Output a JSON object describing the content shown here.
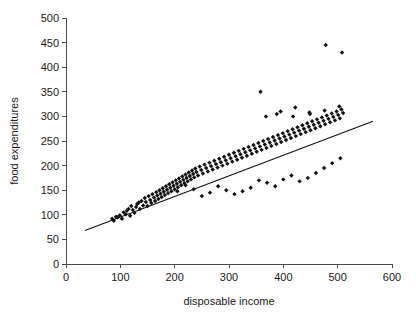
{
  "chart_data": {
    "type": "scatter",
    "title": "",
    "xlabel": "disposable income",
    "ylabel": "food expenditures",
    "xlim": [
      0,
      600
    ],
    "ylim": [
      0,
      500
    ],
    "xticks": [
      0,
      100,
      200,
      300,
      400,
      500,
      600
    ],
    "yticks": [
      0,
      50,
      100,
      150,
      200,
      250,
      300,
      350,
      400,
      450,
      500
    ],
    "grid": false,
    "legend": null,
    "marker": "diamond",
    "marker_color": "#111111",
    "fit_line": {
      "label": "regression line",
      "color": "#111111",
      "x": [
        35,
        565
      ],
      "y": [
        68,
        290
      ]
    },
    "x": [
      85,
      88,
      92,
      95,
      99,
      103,
      106,
      110,
      112,
      115,
      118,
      120,
      123,
      126,
      129,
      131,
      134,
      136,
      139,
      142,
      145,
      147,
      150,
      152,
      155,
      157,
      159,
      162,
      164,
      166,
      168,
      170,
      172,
      174,
      176,
      178,
      180,
      182,
      184,
      186,
      188,
      190,
      192,
      194,
      196,
      198,
      200,
      202,
      204,
      206,
      208,
      210,
      212,
      214,
      216,
      218,
      220,
      222,
      224,
      226,
      228,
      230,
      232,
      234,
      236,
      238,
      240,
      243,
      246,
      249,
      252,
      255,
      258,
      261,
      264,
      267,
      270,
      273,
      276,
      279,
      282,
      285,
      288,
      291,
      294,
      297,
      300,
      303,
      306,
      309,
      312,
      315,
      318,
      321,
      324,
      327,
      330,
      333,
      336,
      339,
      342,
      345,
      348,
      351,
      354,
      357,
      360,
      363,
      366,
      369,
      372,
      375,
      378,
      381,
      384,
      387,
      390,
      393,
      396,
      399,
      402,
      405,
      408,
      411,
      414,
      417,
      420,
      423,
      426,
      429,
      432,
      435,
      438,
      441,
      444,
      447,
      450,
      453,
      456,
      459,
      462,
      465,
      468,
      471,
      474,
      477,
      480,
      483,
      486,
      489,
      492,
      495,
      498,
      501,
      504,
      507,
      510,
      355,
      370,
      385,
      400,
      415,
      430,
      445,
      460,
      475,
      490,
      505,
      340,
      325,
      310,
      295,
      280,
      265,
      250,
      235,
      220,
      205,
      368,
      395,
      422,
      449,
      476,
      503,
      358,
      388,
      418,
      448,
      478,
      508
    ],
    "y": [
      92,
      88,
      96,
      95,
      99,
      92,
      105,
      101,
      108,
      112,
      98,
      118,
      110,
      104,
      116,
      122,
      125,
      112,
      128,
      119,
      134,
      126,
      118,
      138,
      130,
      124,
      142,
      135,
      128,
      146,
      139,
      132,
      150,
      143,
      136,
      154,
      147,
      140,
      158,
      151,
      144,
      162,
      155,
      148,
      166,
      159,
      152,
      170,
      163,
      156,
      174,
      167,
      160,
      178,
      171,
      164,
      182,
      175,
      168,
      186,
      179,
      172,
      190,
      183,
      176,
      194,
      187,
      180,
      198,
      191,
      184,
      202,
      195,
      188,
      206,
      199,
      192,
      210,
      203,
      196,
      214,
      207,
      200,
      218,
      211,
      204,
      222,
      215,
      208,
      226,
      219,
      212,
      230,
      223,
      216,
      234,
      227,
      220,
      238,
      231,
      224,
      242,
      235,
      228,
      246,
      239,
      232,
      250,
      243,
      236,
      254,
      247,
      240,
      258,
      251,
      244,
      262,
      255,
      248,
      266,
      259,
      252,
      270,
      263,
      256,
      274,
      267,
      260,
      278,
      271,
      264,
      282,
      275,
      268,
      286,
      279,
      272,
      290,
      283,
      276,
      294,
      287,
      280,
      298,
      291,
      284,
      302,
      295,
      288,
      306,
      299,
      292,
      310,
      303,
      296,
      314,
      307,
      170,
      165,
      158,
      172,
      180,
      168,
      175,
      185,
      195,
      205,
      215,
      155,
      148,
      142,
      150,
      158,
      145,
      138,
      152,
      160,
      148,
      300,
      310,
      318,
      305,
      312,
      320,
      350,
      305,
      300,
      308,
      445,
      430
    ]
  }
}
